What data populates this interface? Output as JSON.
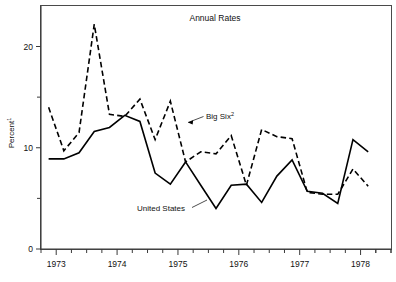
{
  "chart_data": {
    "type": "line",
    "title": "Annual Rates",
    "xlabel": "",
    "ylabel": "Percent¹",
    "ylabel_text": "Percent",
    "ylabel_superscript": "1",
    "xlim": [
      1972.75,
      1978.5
    ],
    "ylim": [
      0,
      24
    ],
    "grid": false,
    "legend": "annotations-on-plot",
    "y_major_ticks": [
      0,
      10,
      20
    ],
    "y_minor_ticks": [
      5,
      15
    ],
    "y_tick_labels": [
      "0",
      "10",
      "20"
    ],
    "x_year_ticks": [
      1973,
      1974,
      1975,
      1976,
      1977,
      1978
    ],
    "x_tick_labels": [
      "1973",
      "1974",
      "1975",
      "1976",
      "1977",
      "1978"
    ],
    "x_minor_ticks_per_year": 4,
    "annotations": [
      {
        "name": "big-six-label",
        "text": "Big Six",
        "superscript": "2",
        "points_to_series": "Big Six²"
      },
      {
        "name": "united-states-label",
        "text": "United States",
        "points_to_series": "United States"
      }
    ],
    "x": [
      1972.875,
      1973.125,
      1973.375,
      1973.625,
      1973.875,
      1974.125,
      1974.375,
      1974.625,
      1974.875,
      1975.125,
      1975.375,
      1975.625,
      1975.875,
      1976.125,
      1976.375,
      1976.625,
      1976.875,
      1977.125,
      1977.375,
      1977.625,
      1977.875,
      1978.125
    ],
    "series": [
      {
        "name": "Big Six²",
        "style": "dashed",
        "values": [
          14.0,
          9.7,
          11.5,
          22.2,
          13.3,
          13.1,
          14.8,
          10.8,
          14.6,
          8.6,
          9.6,
          9.4,
          11.2,
          6.3,
          11.8,
          11.1,
          10.9,
          5.6,
          5.4,
          5.4,
          7.9,
          6.2
        ]
      },
      {
        "name": "United States",
        "style": "solid",
        "values": [
          8.9,
          8.9,
          9.5,
          11.6,
          12.0,
          13.2,
          12.6,
          7.5,
          6.4,
          8.6,
          6.3,
          4.0,
          6.3,
          6.4,
          4.6,
          7.2,
          8.8,
          5.7,
          5.5,
          4.5,
          10.8,
          9.6
        ]
      }
    ]
  },
  "chart": {
    "title": "Annual Rates"
  }
}
